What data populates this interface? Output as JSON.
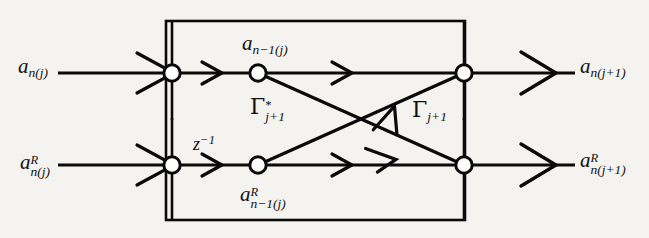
{
  "figure": {
    "name": "lattice-filter-stage-signal-flow-graph",
    "background_color": "#f5f3ef",
    "line_color": "#0a0a0a",
    "node_fill": "#ffffff"
  },
  "labels": {
    "input_forward": {
      "base": "a",
      "sup": "",
      "sub": "n(j)"
    },
    "input_backward": {
      "base": "a",
      "sup": "R",
      "sub": "n(j)"
    },
    "output_forward": {
      "base": "a",
      "sup": "",
      "sub": "n(j+1)"
    },
    "output_backward": {
      "base": "a",
      "sup": "R",
      "sub": "n(j+1)"
    },
    "inner_forward": {
      "base": "a",
      "sup": "",
      "sub": "n−1(j)"
    },
    "inner_backward": {
      "base": "a",
      "sup": "R",
      "sub": "n−1(j)"
    },
    "delay": {
      "base": "z",
      "sup": "−1",
      "sub": ""
    },
    "gamma_conj": {
      "base": "Γ",
      "sup": "*",
      "sub": "j+1"
    },
    "gamma": {
      "base": "Γ",
      "sup": "",
      "sub": "j+1"
    }
  },
  "nodes": {
    "sum_forward_in": {
      "x": 172,
      "y": 73
    },
    "tap_forward": {
      "x": 258,
      "y": 73
    },
    "sum_forward_out": {
      "x": 464,
      "y": 73
    },
    "sum_backward_in": {
      "x": 172,
      "y": 165
    },
    "tap_backward": {
      "x": 258,
      "y": 165
    },
    "sum_backward_out": {
      "x": 464,
      "y": 165
    }
  },
  "box": {
    "x": 166,
    "y": 21,
    "width": 299,
    "height": 199
  }
}
